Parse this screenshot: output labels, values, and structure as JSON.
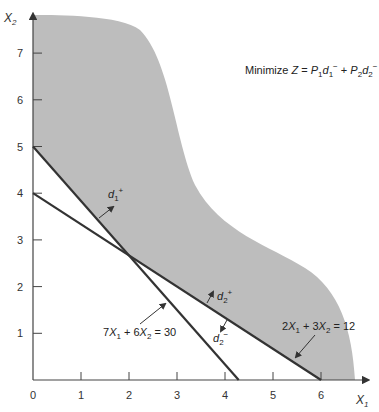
{
  "chart_data": {
    "type": "line",
    "title": "",
    "objective": {
      "prefix": "Minimize ",
      "var": "Z",
      "eq": " = ",
      "p1": "P",
      "p1_sub": "1",
      "d1": "d",
      "d1_sub": "1",
      "d1_sup": "−",
      "plus": " + ",
      "p2": "P",
      "p2_sub": "2",
      "d2": "d",
      "d2_sub": "2",
      "d2_sup": "−"
    },
    "xlabel": {
      "base": "X",
      "sub": "1"
    },
    "ylabel": {
      "base": "X",
      "sub": "2"
    },
    "xlim": [
      0,
      7
    ],
    "ylim": [
      0,
      8
    ],
    "x_ticks": [
      0,
      1,
      2,
      3,
      4,
      5,
      6
    ],
    "y_ticks": [
      1,
      2,
      3,
      4,
      5,
      6,
      7
    ],
    "constraints": [
      {
        "name": "constraint-1",
        "a": 7,
        "b": 6,
        "c": 30,
        "label": {
          "a": "7",
          "x1": "X",
          "x1_sub": "1",
          "plus": " + ",
          "b": "6",
          "x2": "X",
          "x2_sub": "2",
          "rhs": " = 30"
        },
        "deviation_above": {
          "base": "d",
          "sub": "1",
          "sup": "+"
        }
      },
      {
        "name": "constraint-2",
        "a": 2,
        "b": 3,
        "c": 12,
        "label": {
          "a": "2",
          "x1": "X",
          "x1_sub": "1",
          "plus": " + ",
          "b": "3",
          "x2": "X",
          "x2_sub": "2",
          "rhs": " = 12"
        },
        "deviation_above": {
          "base": "d",
          "sub": "2",
          "sup": "+"
        },
        "deviation_below": {
          "base": "d",
          "sub": "2",
          "sup": "−"
        }
      }
    ],
    "feasible_region": "shaded area above both constraint lines",
    "colors": {
      "shade": "#bdbdbd",
      "line": "#333333",
      "axis": "#444444"
    }
  }
}
